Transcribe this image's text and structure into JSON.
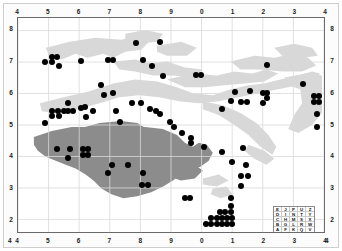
{
  "figure": {
    "title": "",
    "background_color": "#ffffff",
    "frame_color": "#6a6a6a",
    "grid_color": "#d9d9d9",
    "dot_color": "#000000",
    "land_light_color": "#d8d8d8",
    "land_dark_color": "#8c8c8c"
  },
  "chart_data": {
    "type": "scatter",
    "title": "",
    "xlabel": "",
    "ylabel": "",
    "xlim": [
      4,
      14
    ],
    "ylim": [
      1.6,
      8.4
    ],
    "grid": true,
    "legend_position": "bottom-right",
    "axis": {
      "top_ticks": [
        "4",
        "5",
        "6",
        "7",
        "8",
        "9",
        "0",
        "1",
        "2",
        "3",
        "4"
      ],
      "bottom_ticks": [
        "4",
        "5",
        "6",
        "7",
        "8",
        "9",
        "0",
        "1",
        "2",
        "3",
        "4"
      ],
      "left_ticks": [
        "8",
        "7",
        "6",
        "5",
        "4",
        "3",
        "2"
      ],
      "right_ticks": [
        "8",
        "7",
        "6",
        "5",
        "4",
        "3",
        "2"
      ],
      "corner_bottom_left": "4",
      "corner_bottom_right": "4",
      "x_tick_values": [
        4,
        5,
        6,
        7,
        8,
        9,
        10,
        11,
        12,
        13,
        14
      ],
      "y_tick_values": [
        8,
        7,
        6,
        5,
        4,
        3,
        2
      ]
    },
    "points": [
      [
        4.88,
        7.03
      ],
      [
        5.1,
        7.18
      ],
      [
        5.27,
        7.18
      ],
      [
        5.12,
        7.02
      ],
      [
        5.32,
        6.88
      ],
      [
        6.05,
        7.05
      ],
      [
        6.92,
        7.08
      ],
      [
        7.1,
        7.08
      ],
      [
        7.82,
        7.62
      ],
      [
        8.05,
        7.08
      ],
      [
        8.35,
        6.9
      ],
      [
        8.62,
        7.64
      ],
      [
        8.7,
        6.58
      ],
      [
        9.78,
        6.62
      ],
      [
        9.95,
        6.62
      ],
      [
        12.08,
        6.92
      ],
      [
        13.25,
        6.32
      ],
      [
        6.68,
        6.28
      ],
      [
        6.78,
        5.98
      ],
      [
        7.08,
        6.05
      ],
      [
        11.05,
        6.08
      ],
      [
        11.52,
        6.1
      ],
      [
        11.95,
        6.05
      ],
      [
        12.08,
        6.05
      ],
      [
        12.08,
        5.88
      ],
      [
        13.62,
        5.95
      ],
      [
        13.78,
        5.95
      ],
      [
        10.92,
        5.78
      ],
      [
        11.25,
        5.75
      ],
      [
        11.42,
        5.75
      ],
      [
        11.95,
        5.72
      ],
      [
        13.62,
        5.75
      ],
      [
        13.78,
        5.75
      ],
      [
        10.62,
        5.52
      ],
      [
        5.62,
        5.72
      ],
      [
        6.18,
        5.6
      ],
      [
        6.05,
        5.58
      ],
      [
        5.12,
        5.48
      ],
      [
        5.3,
        5.48
      ],
      [
        5.48,
        5.48
      ],
      [
        5.62,
        5.48
      ],
      [
        5.78,
        5.48
      ],
      [
        6.45,
        5.48
      ],
      [
        7.18,
        5.48
      ],
      [
        7.7,
        5.72
      ],
      [
        7.98,
        5.72
      ],
      [
        8.28,
        5.55
      ],
      [
        8.48,
        5.48
      ],
      [
        8.62,
        5.38
      ],
      [
        5.12,
        5.3
      ],
      [
        5.32,
        5.3
      ],
      [
        6.2,
        5.28
      ],
      [
        7.3,
        5.12
      ],
      [
        4.88,
        5.08
      ],
      [
        8.95,
        5.12
      ],
      [
        9.08,
        4.98
      ],
      [
        9.32,
        4.78
      ],
      [
        13.72,
        5.38
      ],
      [
        13.72,
        4.98
      ],
      [
        9.62,
        4.62
      ],
      [
        9.62,
        4.45
      ],
      [
        10.05,
        4.35
      ],
      [
        10.62,
        4.18
      ],
      [
        11.3,
        4.32
      ],
      [
        10.95,
        3.88
      ],
      [
        11.4,
        3.78
      ],
      [
        5.25,
        4.28
      ],
      [
        5.7,
        4.28
      ],
      [
        6.1,
        4.28
      ],
      [
        6.28,
        4.28
      ],
      [
        6.1,
        4.1
      ],
      [
        6.28,
        4.1
      ],
      [
        5.62,
        3.98
      ],
      [
        7.05,
        3.78
      ],
      [
        7.58,
        3.78
      ],
      [
        6.92,
        3.52
      ],
      [
        8.05,
        3.52
      ],
      [
        8.02,
        3.15
      ],
      [
        8.22,
        3.15
      ],
      [
        9.42,
        2.72
      ],
      [
        9.58,
        2.72
      ],
      [
        11.25,
        3.42
      ],
      [
        11.48,
        3.42
      ],
      [
        11.25,
        3.12
      ],
      [
        10.92,
        2.72
      ],
      [
        10.92,
        2.48
      ],
      [
        10.92,
        2.28
      ],
      [
        10.55,
        2.28
      ],
      [
        10.72,
        2.28
      ],
      [
        10.28,
        2.1
      ],
      [
        10.45,
        2.1
      ],
      [
        10.62,
        2.1
      ],
      [
        10.78,
        2.1
      ],
      [
        10.95,
        2.1
      ],
      [
        10.12,
        1.92
      ],
      [
        10.28,
        1.92
      ],
      [
        10.45,
        1.92
      ],
      [
        10.62,
        1.92
      ],
      [
        10.78,
        1.92
      ],
      [
        10.95,
        1.92
      ]
    ],
    "n_points": 100
  },
  "legend": {
    "name": "cipher-square",
    "rows": [
      [
        "E",
        "J",
        "P",
        "U",
        "Z"
      ],
      [
        "D",
        "I",
        "N",
        "T",
        "Y"
      ],
      [
        "C",
        "H",
        "M",
        "S",
        "X"
      ],
      [
        "B",
        "G",
        "L",
        "R",
        "W"
      ],
      [
        "A",
        "F",
        "K",
        "Q",
        "V"
      ]
    ]
  }
}
